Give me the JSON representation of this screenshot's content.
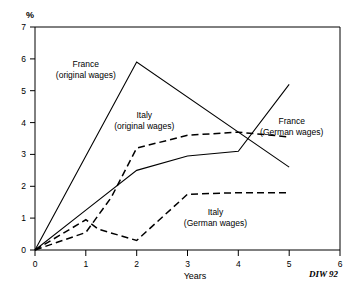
{
  "chart_data": {
    "type": "line",
    "title": "",
    "subtitle": "",
    "xlabel": "Years",
    "ylabel": "%",
    "xlim": [
      0,
      6
    ],
    "ylim": [
      0,
      7
    ],
    "xticks": [
      "0",
      "1",
      "2",
      "3",
      "4",
      "5",
      "6"
    ],
    "yticks": [
      "0",
      "1",
      "2",
      "3",
      "4",
      "5",
      "6",
      "7"
    ],
    "grid": false,
    "legend_position": "inline-annotations",
    "source": "DIW 92",
    "series": [
      {
        "name": "France (original wages)",
        "style": "solid",
        "x": [
          0,
          2,
          5
        ],
        "values": [
          0,
          5.9,
          2.6
        ]
      },
      {
        "name": "France (German wages)",
        "style": "solid",
        "x": [
          0,
          1,
          2,
          3,
          4,
          5
        ],
        "values": [
          0,
          1.25,
          2.5,
          2.95,
          3.1,
          5.2
        ]
      },
      {
        "name": "Italy (original wages)",
        "style": "dashed",
        "x": [
          0,
          1,
          1.5,
          2,
          3,
          4,
          5
        ],
        "values": [
          0,
          0.55,
          1.65,
          3.2,
          3.6,
          3.7,
          3.55
        ]
      },
      {
        "name": "Italy (German wages)",
        "style": "dashed",
        "x": [
          0,
          1,
          1.25,
          2,
          3,
          4,
          5
        ],
        "values": [
          0,
          0.95,
          0.65,
          0.3,
          1.75,
          1.8,
          1.8
        ]
      }
    ],
    "annotations": [
      {
        "id": "france-original",
        "line1": "France",
        "line2": "(original wages)",
        "x": 1.0,
        "y": 5.75
      },
      {
        "id": "italy-original",
        "line1": "Italy",
        "line2": "(original wages)",
        "x": 2.15,
        "y": 4.15
      },
      {
        "id": "france-german",
        "line1": "France",
        "line2": "(German wages)",
        "x": 5.05,
        "y": 3.95
      },
      {
        "id": "italy-german",
        "line1": "Italy",
        "line2": "(German wages)",
        "x": 3.55,
        "y": 1.1
      }
    ]
  }
}
